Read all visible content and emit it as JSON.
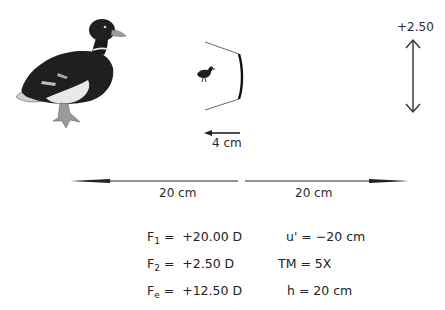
{
  "diagram": {
    "object": {
      "icon": "mallard-duck-icon",
      "label": ""
    },
    "image": {
      "icon": "small-duck-icon"
    },
    "lens": {
      "icon": "concave-lens-icon"
    },
    "lens_power_label": "+2.50",
    "short_arrow_label": "4 cm",
    "left_distance_label": "20 cm",
    "right_distance_label": "20 cm",
    "equations": {
      "left": [
        {
          "symbol": "F",
          "sub": "1",
          "value": "=  +20.00 D"
        },
        {
          "symbol": "F",
          "sub": "2",
          "value": "=  +2.50 D"
        },
        {
          "symbol": "F",
          "sub": "e",
          "value": "=  +12.50 D"
        }
      ],
      "right": [
        {
          "text": "u' = −20 cm"
        },
        {
          "text": "TM = 5X"
        },
        {
          "text": "h = 20 cm"
        }
      ]
    },
    "colors": {
      "ink": "#1e1e1e",
      "background": "#ffffff"
    }
  }
}
